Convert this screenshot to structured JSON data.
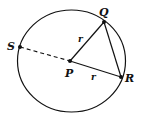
{
  "diagram": {
    "type": "circle-geometry",
    "points": {
      "S": {
        "label": "S"
      },
      "P": {
        "label": "P"
      },
      "Q": {
        "label": "Q"
      },
      "R": {
        "label": "R"
      }
    },
    "segments": {
      "PQ": {
        "label": "r"
      },
      "PR": {
        "label": "r"
      }
    },
    "colors": {
      "stroke": "#111111",
      "background": "#ffffff"
    }
  }
}
